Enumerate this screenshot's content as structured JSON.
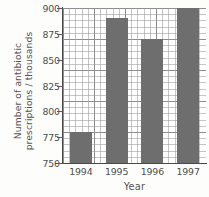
{
  "chart_data": {
    "type": "bar",
    "title": "",
    "xlabel": "Year",
    "ylabel_line1": "Number of antibiotic",
    "ylabel_line2": "prescriptions / thousands",
    "categories": [
      "1994",
      "1995",
      "1996",
      "1997"
    ],
    "values": [
      780,
      890,
      870,
      900
    ],
    "ylim": [
      750,
      900
    ],
    "ytick_labels": [
      "750",
      "775",
      "800",
      "825",
      "850",
      "875",
      "900"
    ],
    "ytick_values": [
      750,
      775,
      800,
      825,
      850,
      875,
      900
    ],
    "grid": true,
    "grid_minor_step": 5,
    "grid_major_step": 25,
    "legend": "none",
    "bar_color": "#6e6e6e",
    "axis_color": "#4a4849",
    "grid_color": "#969696",
    "background_color": "#ffffff"
  }
}
